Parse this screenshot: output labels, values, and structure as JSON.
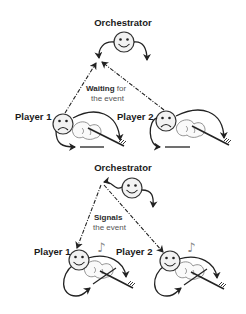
{
  "panels": [
    {
      "id": "waiting",
      "orchestrator_label": "Orchestrator",
      "orchestrator_mood": "happy",
      "note_bold": "Waiting",
      "note_rest_line1": " for",
      "note_line2": "the event",
      "arrow_direction": "players-to-orchestrator",
      "players": [
        {
          "label": "Player 1",
          "mood": "sad",
          "playing": false
        },
        {
          "label": "Player 2",
          "mood": "sad",
          "playing": false
        }
      ]
    },
    {
      "id": "signals",
      "orchestrator_label": "Orchestrator",
      "orchestrator_mood": "happy",
      "note_bold": "Signals",
      "note_line2": "the event",
      "arrow_direction": "orchestrator-to-players",
      "players": [
        {
          "label": "Player 1",
          "mood": "happy",
          "playing": true,
          "music_note": "♪"
        },
        {
          "label": "Player 2",
          "mood": "happy",
          "playing": true,
          "music_note": "♪"
        }
      ]
    }
  ],
  "colors": {
    "ink": "#222222",
    "face_fill": "#f2f2f2",
    "note_text": "#555555"
  }
}
